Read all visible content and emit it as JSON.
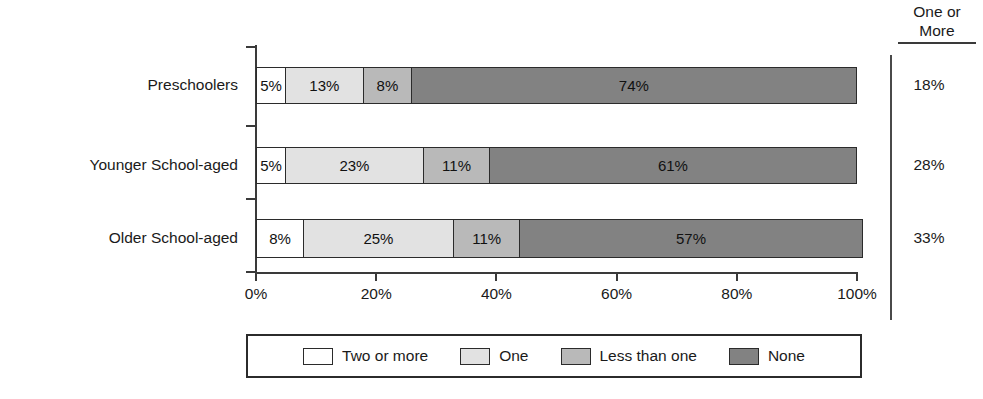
{
  "chart_data": {
    "type": "bar",
    "orientation": "horizontal",
    "stacked": true,
    "stack_mode": "percent",
    "title": "",
    "xlabel": "",
    "ylabel": "",
    "xlim": [
      0,
      100
    ],
    "grid": false,
    "legend_position": "bottom",
    "categories": [
      "Preschoolers",
      "Younger School-aged",
      "Older School-aged"
    ],
    "series": [
      {
        "name": "Two or more",
        "color": "#ffffff",
        "values": [
          5,
          5,
          8
        ],
        "labels": [
          "5%",
          "5%",
          "8%"
        ]
      },
      {
        "name": "One",
        "color": "#e2e2e2",
        "values": [
          13,
          23,
          25
        ],
        "labels": [
          "13%",
          "23%",
          "25%"
        ]
      },
      {
        "name": "Less than one",
        "color": "#b9b9b9",
        "values": [
          8,
          11,
          11
        ],
        "labels": [
          "8%",
          "11%",
          "11%"
        ]
      },
      {
        "name": "None",
        "color": "#828282",
        "values": [
          74,
          61,
          57
        ],
        "labels": [
          "74%",
          "61%",
          "57%"
        ]
      }
    ],
    "xticks": [
      0,
      20,
      40,
      60,
      80,
      100
    ],
    "xticklabels": [
      "0%",
      "20%",
      "40%",
      "60%",
      "80%",
      "100%"
    ],
    "annotation_column": {
      "header_line1": "One or",
      "header_line2": "More",
      "values": [
        "18%",
        "28%",
        "33%"
      ]
    }
  },
  "axis": {
    "ticks": [
      {
        "label": "0%",
        "pct": 0
      },
      {
        "label": "20%",
        "pct": 20
      },
      {
        "label": "40%",
        "pct": 40
      },
      {
        "label": "60%",
        "pct": 60
      },
      {
        "label": "80%",
        "pct": 80
      },
      {
        "label": "100%",
        "pct": 100
      }
    ]
  },
  "rows": [
    {
      "category": "Preschoolers",
      "top": 67,
      "height": 37,
      "label_top": 76,
      "annot_top": 76,
      "annotation": "18%",
      "segments": [
        {
          "key": "two",
          "label": "5%",
          "value": 5,
          "class": "sw-two"
        },
        {
          "key": "one",
          "label": "13%",
          "value": 13,
          "class": "sw-one"
        },
        {
          "key": "less",
          "label": "8%",
          "value": 8,
          "class": "sw-less"
        },
        {
          "key": "none",
          "label": "74%",
          "value": 74,
          "class": "sw-none"
        }
      ]
    },
    {
      "category": "Younger School-aged",
      "top": 147,
      "height": 37,
      "label_top": 156,
      "annot_top": 156,
      "annotation": "28%",
      "segments": [
        {
          "key": "two",
          "label": "5%",
          "value": 5,
          "class": "sw-two"
        },
        {
          "key": "one",
          "label": "23%",
          "value": 23,
          "class": "sw-one"
        },
        {
          "key": "less",
          "label": "11%",
          "value": 11,
          "class": "sw-less"
        },
        {
          "key": "none",
          "label": "61%",
          "value": 61,
          "class": "sw-none"
        }
      ]
    },
    {
      "category": "Older School-aged",
      "top": 219,
      "height": 39,
      "label_top": 229,
      "annot_top": 229,
      "annotation": "33%",
      "segments": [
        {
          "key": "two",
          "label": "8%",
          "value": 8,
          "class": "sw-two"
        },
        {
          "key": "one",
          "label": "25%",
          "value": 25,
          "class": "sw-one"
        },
        {
          "key": "less",
          "label": "11%",
          "value": 11,
          "class": "sw-less"
        },
        {
          "key": "none",
          "label": "57%",
          "value": 57,
          "class": "sw-none"
        }
      ]
    }
  ],
  "yticks": [
    46,
    125,
    198,
    271
  ],
  "legend": {
    "items": [
      {
        "label": "Two or more",
        "class": "sw-two"
      },
      {
        "label": "One",
        "class": "sw-one"
      },
      {
        "label": "Less than one",
        "class": "sw-less"
      },
      {
        "label": "None",
        "class": "sw-none"
      }
    ]
  }
}
